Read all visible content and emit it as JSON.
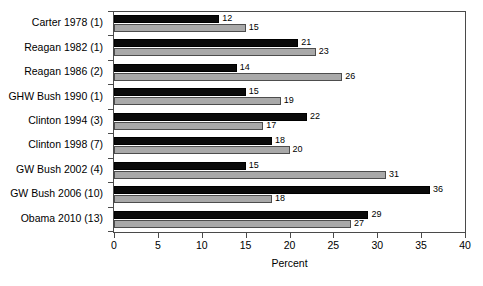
{
  "chart_data": {
    "type": "bar",
    "orientation": "horizontal",
    "title": "",
    "xlabel": "Percent",
    "ylabel": "",
    "xlim": [
      0,
      40
    ],
    "xticks": [
      0,
      5,
      10,
      15,
      20,
      25,
      30,
      35,
      40
    ],
    "grid": false,
    "legend": null,
    "categories": [
      "Carter 1978 (1)",
      "Reagan 1982 (1)",
      "Reagan 1986 (2)",
      "GHW Bush 1990 (1)",
      "Clinton 1994 (3)",
      "Clinton 1998 (7)",
      "GW Bush 2002 (4)",
      "GW Bush 2006 (10)",
      "Obama 2010 (13)"
    ],
    "series": [
      {
        "name": "series-black",
        "color": "#0a0a0a",
        "values": [
          12,
          21,
          14,
          15,
          22,
          18,
          15,
          36,
          29
        ]
      },
      {
        "name": "series-gray",
        "color": "#a9a9a9",
        "values": [
          15,
          23,
          26,
          19,
          17,
          20,
          31,
          18,
          27
        ]
      }
    ]
  }
}
